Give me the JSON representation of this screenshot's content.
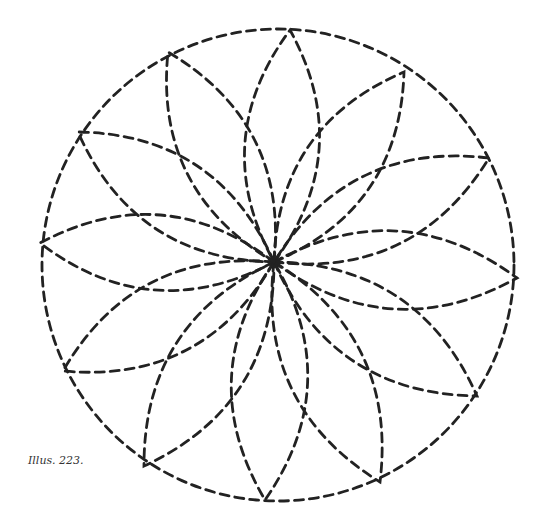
{
  "caption": "Illus. 223.",
  "figure": {
    "stroke_color": "#222222",
    "stroke_width": 2.8,
    "dash": "9 6",
    "circle": {
      "cx": 278,
      "cy": 265,
      "r": 236
    },
    "center": {
      "x": 274,
      "y": 262
    },
    "petal_width_factor": 0.32,
    "petal_tips": [
      [
        290,
        30
      ],
      [
        404,
        72
      ],
      [
        489,
        158
      ],
      [
        517,
        278
      ],
      [
        477,
        396
      ],
      [
        380,
        482
      ],
      [
        265,
        500
      ],
      [
        144,
        466
      ],
      [
        63,
        371
      ],
      [
        40,
        243
      ],
      [
        78,
        132
      ],
      [
        168,
        52
      ]
    ]
  }
}
